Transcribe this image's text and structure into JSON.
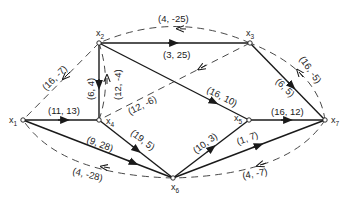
{
  "nodes": [
    {
      "id": "x1",
      "name": "x",
      "sub": "1",
      "x": 23,
      "y": 120
    },
    {
      "id": "x2",
      "name": "x",
      "sub": "2",
      "x": 99,
      "y": 43
    },
    {
      "id": "x3",
      "name": "x",
      "sub": "3",
      "x": 250,
      "y": 43
    },
    {
      "id": "x4",
      "name": "x",
      "sub": "4",
      "x": 99,
      "y": 120
    },
    {
      "id": "x5",
      "name": "x",
      "sub": "5",
      "x": 249,
      "y": 120
    },
    {
      "id": "x6",
      "name": "x",
      "sub": "6",
      "x": 173,
      "y": 178
    },
    {
      "id": "x7",
      "name": "x",
      "sub": "7",
      "x": 325,
      "y": 120
    }
  ],
  "solid_edges": [
    {
      "from": "x2",
      "to": "x3",
      "label": "(3, 25)"
    },
    {
      "from": "x2",
      "to": "x4",
      "label": "(6, 4)"
    },
    {
      "from": "x2",
      "to": "x5",
      "label": "(16, 10)"
    },
    {
      "from": "x3",
      "to": "x7",
      "label": "(6, 5)"
    },
    {
      "from": "x1",
      "to": "x4",
      "label": "(11, 13)"
    },
    {
      "from": "x1",
      "to": "x6",
      "label": "(9, 28)"
    },
    {
      "from": "x4",
      "to": "x6",
      "label": "(19, 5)"
    },
    {
      "from": "x6",
      "to": "x5",
      "label": "(10, 3)"
    },
    {
      "from": "x6",
      "to": "x7",
      "label": "(1, 7)"
    },
    {
      "from": "x5",
      "to": "x7",
      "label": "(16, 12)"
    }
  ],
  "dashed_edges": [
    {
      "from": "x2",
      "to": "x1",
      "label": "(16, -7)"
    },
    {
      "from": "x3",
      "to": "x2",
      "label": "(4, -25)"
    },
    {
      "from": "x4",
      "to": "x2",
      "label": "(12, -4)"
    },
    {
      "from": "x3",
      "to": "x4",
      "label": "(12, -6)"
    },
    {
      "from": "x7",
      "to": "x3",
      "label": "(16, -5)"
    },
    {
      "from": "x6",
      "to": "x1",
      "label": "(4, -28)"
    },
    {
      "from": "x7",
      "to": "x6",
      "label": "(4, -7)"
    }
  ]
}
